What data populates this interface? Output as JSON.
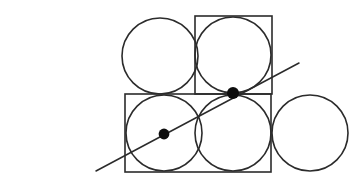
{
  "figure": {
    "label": "(iii)",
    "canvas": {
      "width": 364,
      "height": 183
    },
    "background_color": "#ffffff",
    "stroke_color": "#2b2b2b",
    "dot_color": "#0d0d0d",
    "stroke_width": 1.6,
    "line_stroke_width": 1.5
  },
  "squares": [
    {
      "name": "top-right-square",
      "x": 195,
      "y": 16,
      "width": 77,
      "height": 78
    },
    {
      "name": "bottom-left-square",
      "x": 125,
      "y": 94,
      "width": 146,
      "height": 78
    }
  ],
  "circles": [
    {
      "name": "top-left-circle",
      "cx": 160,
      "cy": 56,
      "r": 38
    },
    {
      "name": "top-right-circle",
      "cx": 233,
      "cy": 55,
      "r": 38
    },
    {
      "name": "bottom-left-circle",
      "cx": 164,
      "cy": 133,
      "r": 38
    },
    {
      "name": "bottom-middle-circle",
      "cx": 233,
      "cy": 133,
      "r": 38
    },
    {
      "name": "bottom-right-circle",
      "cx": 310,
      "cy": 133,
      "r": 38
    }
  ],
  "secant_line": {
    "name": "secant-line",
    "x1": 96,
    "y1": 171,
    "x2": 299,
    "y2": 63
  },
  "marked_points": [
    {
      "name": "upper-marked-point",
      "cx": 233,
      "cy": 93,
      "r": 6.0
    },
    {
      "name": "lower-marked-point",
      "cx": 164,
      "cy": 134,
      "r": 5.4
    }
  ]
}
